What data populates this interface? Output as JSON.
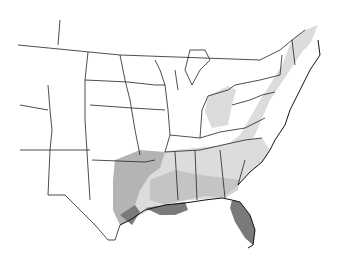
{
  "map": {
    "title": "",
    "region": "Contiguous United States (central and eastern) with shaded distribution zones",
    "legend": [],
    "shading": {
      "light": "#dcdcdc",
      "medium": "#b4b4b4",
      "dark": "#7a7a7a",
      "border": "#222222",
      "background": "#ffffff"
    },
    "zones": [
      {
        "name": "light-zone",
        "description": "Gulf and Atlantic coastal plain, Ohio valley, Atlantic seaboard to Nova Scotia"
      },
      {
        "name": "medium-zone",
        "description": "Texas, lower Mississippi valley, Gulf coast"
      },
      {
        "name": "dark-zone",
        "description": "Florida peninsula, Louisiana coast"
      }
    ]
  }
}
